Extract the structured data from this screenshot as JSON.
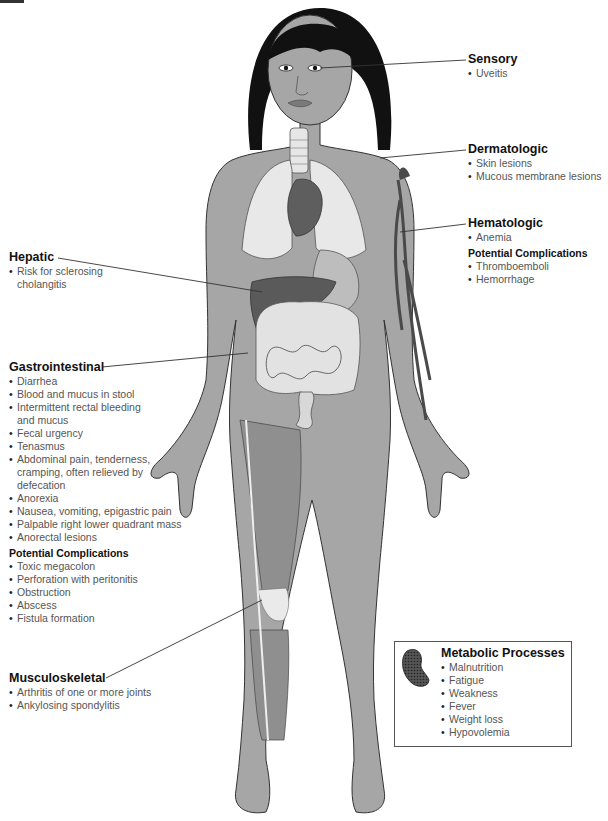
{
  "figure": {
    "colors": {
      "skin": "#a4a4a4",
      "hair": "#111111",
      "lungs": "#e8e8e8",
      "liver": "#5a5a5a",
      "intestines": "#e6e6e6",
      "veins": "#4a4a4a",
      "outline": "#333333"
    }
  },
  "labels": {
    "sensory": {
      "title": "Sensory",
      "items": [
        "Uveitis"
      ]
    },
    "dermatologic": {
      "title": "Dermatologic",
      "items": [
        "Skin lesions",
        "Mucous membrane lesions"
      ]
    },
    "hematologic": {
      "title": "Hematologic",
      "items": [
        "Anemia"
      ],
      "complications_title": "Potential Complications",
      "complications": [
        "Thromboemboli",
        "Hemorrhage"
      ]
    },
    "hepatic": {
      "title": "Hepatic",
      "items": [
        "Risk for sclerosing cholangitis"
      ]
    },
    "gastrointestinal": {
      "title": "Gastrointestinal",
      "items": [
        "Diarrhea",
        "Blood and mucus in stool",
        "Intermittent rectal bleeding and mucus",
        "Fecal urgency",
        "Tenasmus",
        "Abdominal pain, tenderness, cramping, often relieved by defecation",
        "Anorexia",
        "Nausea, vomiting, epigastric pain",
        "Palpable right lower quadrant mass",
        "Anorectal lesions"
      ],
      "complications_title": "Potential Complications",
      "complications": [
        "Toxic megacolon",
        "Perforation with peritonitis",
        "Obstruction",
        "Abscess",
        "Fistula formation"
      ]
    },
    "musculoskeletal": {
      "title": "Musculoskeletal",
      "items": [
        "Arthritis of one or more joints",
        "Ankylosing spondylitis"
      ]
    },
    "metabolic": {
      "title": "Metabolic Processes",
      "icon": "cell-icon",
      "items": [
        "Malnutrition",
        "Fatigue",
        "Weakness",
        "Fever",
        "Weight loss",
        "Hypovolemia"
      ]
    }
  }
}
